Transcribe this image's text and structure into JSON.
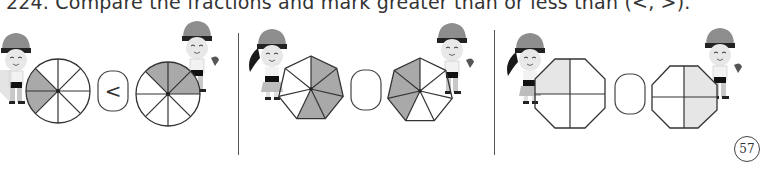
{
  "question": {
    "number": "224.",
    "text": "224. Compare the fractions and mark greater than or less than (<, >)."
  },
  "colors": {
    "shade": "#a9a9a9",
    "light_shade": "#e6e6e6",
    "outline": "#333333",
    "divider": "#555555"
  },
  "problems": [
    {
      "id": "p1",
      "shape": "circle",
      "left": {
        "slices": 8,
        "shaded": 2,
        "fraction": "2/8"
      },
      "right": {
        "slices": 8,
        "shaded": 3,
        "fraction": "3/8"
      },
      "answer_box": "<"
    },
    {
      "id": "p2",
      "shape": "heptagon",
      "left": {
        "slices": 7,
        "shaded": 4,
        "fraction": "4/7"
      },
      "right": {
        "slices": 7,
        "shaded": 3,
        "fraction": "3/7"
      },
      "answer_box": ""
    },
    {
      "id": "p3",
      "shape": "octagon",
      "left": {
        "slices": 4,
        "shaded": 1,
        "fraction": "1/4"
      },
      "right": {
        "slices": 4,
        "shaded": 2,
        "fraction": "2/4"
      },
      "answer_box": ""
    }
  ],
  "page_number": "57",
  "icons": {
    "character_girl": "pirate-girl-icon",
    "character_boy": "pirate-boy-icon"
  }
}
